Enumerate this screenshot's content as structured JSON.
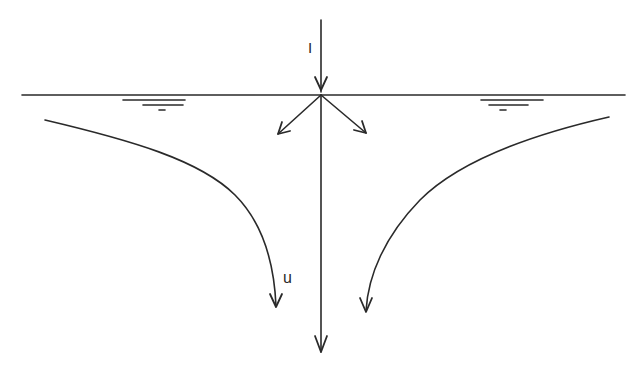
{
  "diagram": {
    "title": "",
    "labels": {
      "incident": "I",
      "streamline": "u"
    },
    "colors": {
      "ink": "#2a2a2a",
      "background": "#ffffff"
    },
    "elements": [
      {
        "id": "water-surface",
        "type": "line",
        "description": "horizontal free surface"
      },
      {
        "id": "incident-arrow",
        "type": "arrow",
        "label": "I",
        "direction": "down"
      },
      {
        "id": "diverging-arrow-left",
        "type": "arrow",
        "direction": "down-left"
      },
      {
        "id": "diverging-arrow-right",
        "type": "arrow",
        "direction": "down-right"
      },
      {
        "id": "vertical-arrow",
        "type": "arrow",
        "direction": "down"
      },
      {
        "id": "streamline-left",
        "type": "curved-arrow",
        "label": "u"
      },
      {
        "id": "streamline-right",
        "type": "curved-arrow"
      },
      {
        "id": "surface-symbol-left",
        "type": "water-level-symbol"
      },
      {
        "id": "surface-symbol-right",
        "type": "water-level-symbol"
      }
    ]
  }
}
